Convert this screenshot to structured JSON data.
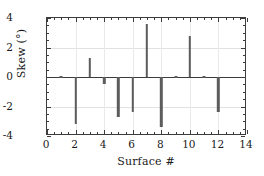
{
  "chart_data": {
    "type": "bar",
    "title": "",
    "subtitle": "",
    "xlabel": "Surface #",
    "ylabel": "Skew (°)",
    "xlim": [
      0,
      14
    ],
    "ylim": [
      -4,
      4
    ],
    "x_ticks": [
      0,
      2,
      4,
      6,
      8,
      10,
      12,
      14
    ],
    "x_tick_labels": [
      "0",
      "2",
      "4",
      "6",
      "8",
      "10",
      "12",
      "14"
    ],
    "x_minor_step": 0.5,
    "y_ticks": [
      -4,
      -2,
      0,
      2,
      4
    ],
    "y_tick_labels": [
      "-4",
      "-2",
      "0",
      "2",
      "4"
    ],
    "y_minor_step": 0.5,
    "grid": true,
    "grid_axis": "both",
    "legend": null,
    "legend_position": "none",
    "zero_line": 0,
    "bar_color": "#5c5c5c",
    "axis_color": "#3c3c3c",
    "grid_color": "#e2e2e6",
    "background": "#ffffff",
    "categories": [
      1,
      2,
      3,
      4,
      5,
      6,
      7,
      8,
      9,
      10,
      11,
      12
    ],
    "values": [
      0.0,
      -3.2,
      1.3,
      -0.5,
      -2.7,
      -2.4,
      3.6,
      -3.4,
      0.0,
      2.8,
      0.0,
      -2.4
    ],
    "series": [
      {
        "name": "Skew",
        "values": [
          0.0,
          -3.2,
          1.3,
          -0.5,
          -2.7,
          -2.4,
          3.6,
          -3.4,
          0.0,
          2.8,
          0.0,
          -2.4
        ]
      }
    ],
    "annotations": []
  }
}
